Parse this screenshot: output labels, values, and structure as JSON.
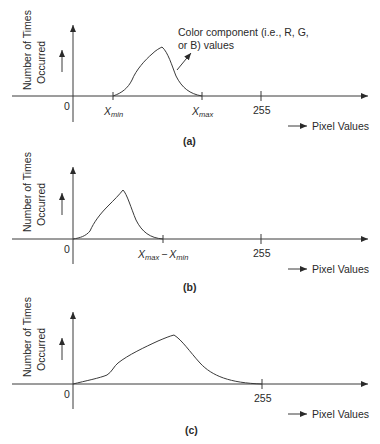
{
  "panels": [
    {
      "id": "a",
      "caption": "(a)",
      "y_label_line1": "Number of Times",
      "y_label_line2": "Occurred",
      "x_axis_label": "Pixel Values",
      "origin_label": "0",
      "tick_labels": {
        "xmin": {
          "main": "X",
          "sub": "min"
        },
        "xmax": {
          "main": "X",
          "sub": "max"
        },
        "max_value": "255"
      },
      "annotation_line1": "Color component (i.e., R, G,",
      "annotation_line2": "or B) values"
    },
    {
      "id": "b",
      "caption": "(b)",
      "y_label_line1": "Number of Times",
      "y_label_line2": "Occurred",
      "x_axis_label": "Pixel Values",
      "origin_label": "0",
      "tick_labels": {
        "xmax": {
          "main": "X",
          "sub": "max"
        },
        "separator": "−",
        "xmin": {
          "main": "X",
          "sub": "min"
        },
        "max_value": "255"
      }
    },
    {
      "id": "c",
      "caption": "(c)",
      "y_label_line1": "Number of Times",
      "y_label_line2": "Occurred",
      "x_axis_label": "Pixel Values",
      "origin_label": "0",
      "tick_labels": {
        "max_value": "255"
      }
    }
  ],
  "colors": {
    "line": "#3a3a3a",
    "text": "#2a2a2a",
    "background": "#ffffff"
  }
}
